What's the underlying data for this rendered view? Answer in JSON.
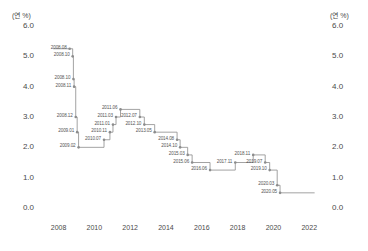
{
  "axes": {
    "unit_left": "(연 %)",
    "unit_right": "(연 %)",
    "yticks_left": [
      "6.0",
      "5.0",
      "4.0",
      "3.0",
      "2.0",
      "1.0",
      "0.0"
    ],
    "yticks_right": [
      "6.0",
      "5.0",
      "4.0",
      "3.0",
      "2.0",
      "1.0",
      "0.0"
    ],
    "xticks": [
      "2008",
      "2010",
      "2012",
      "2014",
      "2016",
      "2018",
      "2020",
      "2022"
    ]
  },
  "chart_data": {
    "type": "line",
    "title": "",
    "subtitle": "",
    "xlabel": "",
    "ylabel": "(연 %)",
    "xlim": [
      2007.3,
      2022.6
    ],
    "ylim": [
      0.0,
      6.0
    ],
    "grid": false,
    "legend": null,
    "step_style": "post",
    "series": [
      {
        "name": "기준금리",
        "color": "#888888",
        "points": [
          {
            "label": "2008.08",
            "x": 2008.62,
            "y": 5.25
          },
          {
            "label": "2008.10",
            "x": 2008.79,
            "y": 5.0
          },
          {
            "label": "2008.10",
            "x": 2008.83,
            "y": 4.25
          },
          {
            "label": "2008.11",
            "x": 2008.87,
            "y": 4.0
          },
          {
            "label": "2008.12",
            "x": 2008.96,
            "y": 3.0
          },
          {
            "label": "2009.01",
            "x": 2009.04,
            "y": 2.5
          },
          {
            "label": "2009.02",
            "x": 2009.12,
            "y": 2.0
          },
          {
            "label": "2010.07",
            "x": 2010.54,
            "y": 2.25
          },
          {
            "label": "2010.11",
            "x": 2010.87,
            "y": 2.5
          },
          {
            "label": "2011.01",
            "x": 2011.04,
            "y": 2.75
          },
          {
            "label": "2011.03",
            "x": 2011.21,
            "y": 3.0
          },
          {
            "label": "2011.06",
            "x": 2011.46,
            "y": 3.25
          },
          {
            "label": "2012.07",
            "x": 2012.54,
            "y": 3.0
          },
          {
            "label": "2012.10",
            "x": 2012.79,
            "y": 2.75
          },
          {
            "label": "2013.05",
            "x": 2013.37,
            "y": 2.5
          },
          {
            "label": "2014.08",
            "x": 2014.62,
            "y": 2.25
          },
          {
            "label": "2014.10",
            "x": 2014.79,
            "y": 2.0
          },
          {
            "label": "2015.03",
            "x": 2015.21,
            "y": 1.75
          },
          {
            "label": "2015.06",
            "x": 2015.46,
            "y": 1.5
          },
          {
            "label": "2016.06",
            "x": 2016.46,
            "y": 1.25
          },
          {
            "label": "2017.11",
            "x": 2017.87,
            "y": 1.5
          },
          {
            "label": "2018.11",
            "x": 2018.87,
            "y": 1.75
          },
          {
            "label": "2019.07",
            "x": 2019.54,
            "y": 1.5
          },
          {
            "label": "2019.10",
            "x": 2019.79,
            "y": 1.25
          },
          {
            "label": "2020.03",
            "x": 2020.21,
            "y": 0.75
          },
          {
            "label": "2020.05",
            "x": 2020.37,
            "y": 0.5
          }
        ]
      }
    ]
  }
}
